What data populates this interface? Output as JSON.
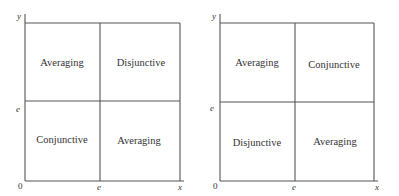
{
  "panels": [
    {
      "origin_label": "0",
      "x_axis_label": "x",
      "y_axis_label": "y",
      "x_threshold_label": "e",
      "y_threshold_label": "e",
      "quadrants": {
        "top_left": "Averaging",
        "top_right": "Disjunctive",
        "bottom_left": "Conjunctive",
        "bottom_right": "Averaging"
      }
    },
    {
      "origin_label": "0",
      "x_axis_label": "x",
      "y_axis_label": "y",
      "x_threshold_label": "e",
      "y_threshold_label": "e",
      "quadrants": {
        "top_left": "Averaging",
        "top_right": "Conjunctive",
        "bottom_left": "Disjunctive",
        "bottom_right": "Averaging"
      }
    }
  ]
}
